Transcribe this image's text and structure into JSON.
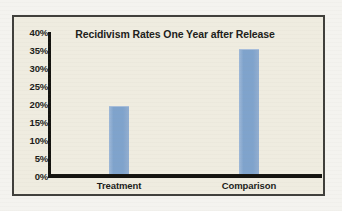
{
  "chart_data": {
    "type": "bar",
    "title": "Recidivism Rates One Year after Release",
    "xlabel": "",
    "ylabel": "",
    "categories": [
      "Treatment",
      "Comparison"
    ],
    "values": [
      19,
      35
    ],
    "value_labels": [
      "19%",
      "35%"
    ],
    "ylim": [
      0,
      40
    ],
    "ytick_values": [
      40,
      35,
      30,
      25,
      20,
      15,
      10,
      5,
      0
    ],
    "ytick_labels": [
      "40%",
      "35%",
      "30%",
      "25%",
      "20%",
      "15%",
      "10%",
      "5%",
      "0%"
    ],
    "grid": false,
    "legend": false,
    "legend_position": "none",
    "bar_color": "#7FA3CC",
    "axis_color": "#14130F",
    "plot_background": "#EFECE0",
    "frame_border_color": "#403F3B",
    "text_color": "#1C1C1A"
  },
  "ticks": {
    "t0": "40%",
    "t1": "35%",
    "t2": "30%",
    "t3": "25%",
    "t4": "20%",
    "t5": "15%",
    "t6": "10%",
    "t7": "5%",
    "t8": "0%"
  },
  "categories": {
    "c0": "Treatment",
    "c1": "Comparison"
  }
}
